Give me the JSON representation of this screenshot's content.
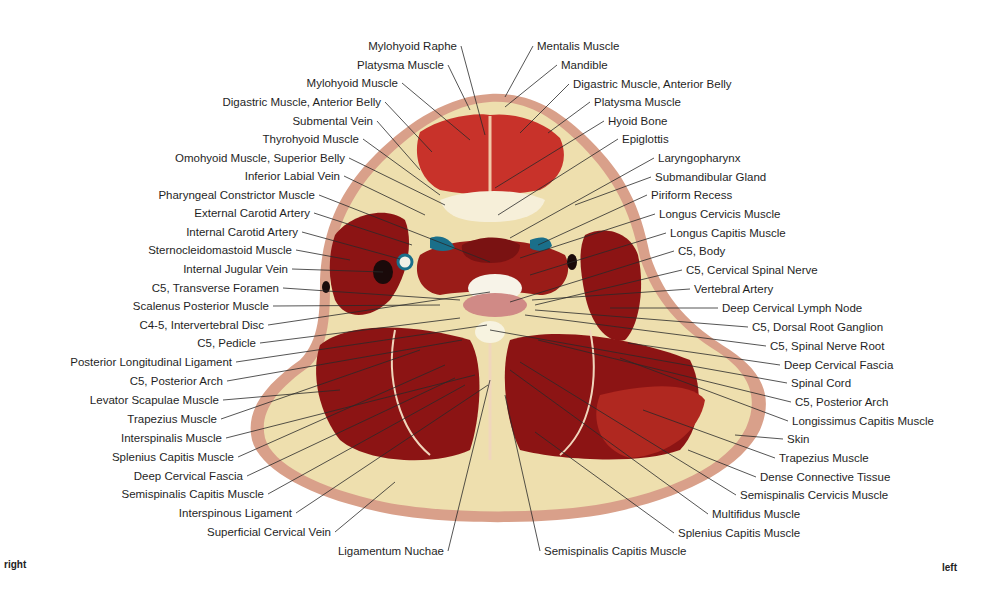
{
  "figure": {
    "type": "anatomical cross-section",
    "orientation": {
      "left_side_label": "right",
      "right_side_label": "left"
    },
    "colors": {
      "muscle": "#8c1414",
      "muscle_light": "#c8322a",
      "fat": "#eedfae",
      "skin": "#d9a08a",
      "fascia": "#f3e8cc",
      "vessel_blue": "#1a6f8a",
      "vein_dark": "#1a0a0a",
      "label_text": "#1f1f1f",
      "leader_line": "#2a2a2a"
    }
  },
  "labels_left": [
    {
      "text": "Mylohyoid Raphe",
      "x": 457,
      "y": 46,
      "tx": 485,
      "ty": 135
    },
    {
      "text": "Platysma Muscle",
      "x": 444,
      "y": 65,
      "tx": 470,
      "ty": 110
    },
    {
      "text": "Mylohyoid Muscle",
      "x": 398,
      "y": 83,
      "tx": 470,
      "ty": 140
    },
    {
      "text": "Digastric Muscle, Anterior Belly",
      "x": 381,
      "y": 102,
      "tx": 432,
      "ty": 152
    },
    {
      "text": "Submental Vein",
      "x": 373,
      "y": 121,
      "tx": 420,
      "ty": 170
    },
    {
      "text": "Thyrohyoid Muscle",
      "x": 359,
      "y": 139,
      "tx": 440,
      "ty": 195
    },
    {
      "text": "Omohyoid Muscle, Superior Belly",
      "x": 345,
      "y": 158,
      "tx": 445,
      "ty": 205
    },
    {
      "text": "Inferior Labial Vein",
      "x": 340,
      "y": 176,
      "tx": 425,
      "ty": 215
    },
    {
      "text": "Pharyngeal Constrictor Muscle",
      "x": 315,
      "y": 195,
      "tx": 490,
      "ty": 262
    },
    {
      "text": "External Carotid Artery",
      "x": 310,
      "y": 213,
      "tx": 412,
      "ty": 245
    },
    {
      "text": "Internal Carotid Artery",
      "x": 298,
      "y": 232,
      "tx": 400,
      "ty": 259
    },
    {
      "text": "Sternocleidomastoid Muscle",
      "x": 292,
      "y": 250,
      "tx": 350,
      "ty": 260
    },
    {
      "text": "Internal Jugular Vein",
      "x": 288,
      "y": 269,
      "tx": 383,
      "ty": 272
    },
    {
      "text": "C5, Transverse Foramen",
      "x": 279,
      "y": 288,
      "tx": 460,
      "ty": 300
    },
    {
      "text": "Scalenus Posterior Muscle",
      "x": 269,
      "y": 306,
      "tx": 440,
      "ty": 305
    },
    {
      "text": "C4-5, Intervertebral Disc",
      "x": 264,
      "y": 325,
      "tx": 490,
      "ty": 292
    },
    {
      "text": "C5, Pedicle",
      "x": 256,
      "y": 343,
      "tx": 460,
      "ty": 318
    },
    {
      "text": "Posterior Longitudinal Ligament",
      "x": 232,
      "y": 362,
      "tx": 487,
      "ty": 325
    },
    {
      "text": "C5, Posterior Arch",
      "x": 223,
      "y": 381,
      "tx": 462,
      "ty": 340
    },
    {
      "text": "Levator Scapulae Muscle",
      "x": 219,
      "y": 400,
      "tx": 340,
      "ty": 390
    },
    {
      "text": "Trapezius Muscle",
      "x": 217,
      "y": 419,
      "tx": 420,
      "ty": 350
    },
    {
      "text": "Interspinalis Muscle",
      "x": 222,
      "y": 438,
      "tx": 475,
      "ty": 375
    },
    {
      "text": "Splenius Capitis Muscle",
      "x": 234,
      "y": 457,
      "tx": 445,
      "ty": 365
    },
    {
      "text": "Deep Cervical Fascia",
      "x": 243,
      "y": 476,
      "tx": 455,
      "ty": 378
    },
    {
      "text": "Semispinalis Capitis Muscle",
      "x": 264,
      "y": 494,
      "tx": 465,
      "ty": 385
    },
    {
      "text": "Interspinous Ligament",
      "x": 292,
      "y": 513,
      "tx": 488,
      "ty": 385
    },
    {
      "text": "Superficial Cervical Vein",
      "x": 331,
      "y": 532,
      "tx": 395,
      "ty": 482
    },
    {
      "text": "Ligamentum Nuchae",
      "x": 444,
      "y": 551,
      "tx": 490,
      "ty": 380
    }
  ],
  "labels_right": [
    {
      "text": "Mentalis Muscle",
      "x": 537,
      "y": 46,
      "tx": 505,
      "ty": 97
    },
    {
      "text": "Mandible",
      "x": 561,
      "y": 65,
      "tx": 505,
      "ty": 107
    },
    {
      "text": "Digastric Muscle, Anterior Belly",
      "x": 573,
      "y": 84,
      "tx": 520,
      "ty": 133
    },
    {
      "text": "Platysma Muscle",
      "x": 594,
      "y": 102,
      "tx": 548,
      "ty": 133
    },
    {
      "text": "Hyoid Bone",
      "x": 608,
      "y": 121,
      "tx": 495,
      "ty": 188
    },
    {
      "text": "Epiglottis",
      "x": 622,
      "y": 139,
      "tx": 498,
      "ty": 215
    },
    {
      "text": "Laryngopharynx",
      "x": 658,
      "y": 158,
      "tx": 510,
      "ty": 238
    },
    {
      "text": "Submandibular Gland",
      "x": 655,
      "y": 177,
      "tx": 575,
      "ty": 205
    },
    {
      "text": "Piriform Recess",
      "x": 651,
      "y": 195,
      "tx": 538,
      "ty": 245
    },
    {
      "text": "Longus Cervicis Muscle",
      "x": 659,
      "y": 214,
      "tx": 520,
      "ty": 258
    },
    {
      "text": "Longus Capitis Muscle",
      "x": 670,
      "y": 233,
      "tx": 530,
      "ty": 275
    },
    {
      "text": "C5, Body",
      "x": 678,
      "y": 251,
      "tx": 510,
      "ty": 302
    },
    {
      "text": "C5, Cervical Spinal Nerve",
      "x": 686,
      "y": 270,
      "tx": 535,
      "ty": 305
    },
    {
      "text": "Vertebral Artery",
      "x": 694,
      "y": 289,
      "tx": 532,
      "ty": 300
    },
    {
      "text": "Deep Cervical Lymph Node",
      "x": 722,
      "y": 308,
      "tx": 610,
      "ty": 308
    },
    {
      "text": "C5, Dorsal Root Ganglion",
      "x": 752,
      "y": 327,
      "tx": 535,
      "ty": 310
    },
    {
      "text": "C5, Spinal Nerve Root",
      "x": 770,
      "y": 346,
      "tx": 525,
      "ty": 315
    },
    {
      "text": "Deep Cervical Fascia",
      "x": 784,
      "y": 365,
      "tx": 628,
      "ty": 343
    },
    {
      "text": "Spinal Cord",
      "x": 791,
      "y": 383,
      "tx": 490,
      "ty": 330
    },
    {
      "text": "C5, Posterior Arch",
      "x": 795,
      "y": 402,
      "tx": 538,
      "ty": 340
    },
    {
      "text": "Longissimus Capitis Muscle",
      "x": 792,
      "y": 421,
      "tx": 620,
      "ty": 358
    },
    {
      "text": "Skin",
      "x": 787,
      "y": 439,
      "tx": 735,
      "ty": 435
    },
    {
      "text": "Trapezius Muscle",
      "x": 779,
      "y": 458,
      "tx": 643,
      "ty": 410
    },
    {
      "text": "Dense Connective Tissue",
      "x": 760,
      "y": 477,
      "tx": 688,
      "ty": 450
    },
    {
      "text": "Semispinalis Cervicis Muscle",
      "x": 740,
      "y": 495,
      "tx": 520,
      "ty": 362
    },
    {
      "text": "Multifidus Muscle",
      "x": 712,
      "y": 514,
      "tx": 510,
      "ty": 370
    },
    {
      "text": "Splenius Capitis Muscle",
      "x": 678,
      "y": 533,
      "tx": 535,
      "ty": 432
    },
    {
      "text": "Semispinalis Capitis Muscle",
      "x": 544,
      "y": 551,
      "tx": 505,
      "ty": 395
    }
  ]
}
